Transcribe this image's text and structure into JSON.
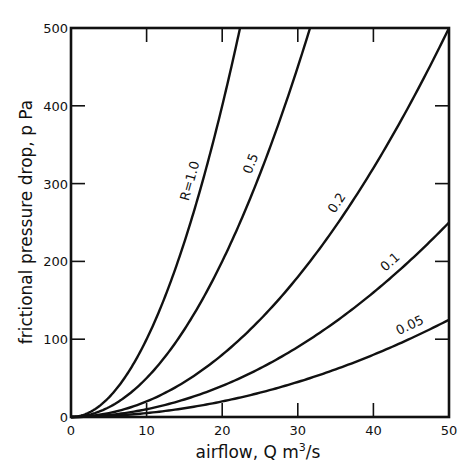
{
  "chart_data": {
    "type": "line",
    "title": "",
    "xlabel": "airflow,  Q  m³/s",
    "ylabel": "frictional pressure drop,  p  Pa",
    "xlim": [
      0,
      50
    ],
    "ylim": [
      0,
      500
    ],
    "x_ticks": [
      0,
      10,
      20,
      30,
      40,
      50
    ],
    "y_ticks": [
      0,
      100,
      200,
      300,
      400,
      500
    ],
    "grid": false,
    "legend": "inline labels on curves",
    "equation": "p = R * Q^2",
    "series": [
      {
        "name": "R=1.0",
        "label": "R=1.0",
        "R": 1.0,
        "x": [
          0,
          5,
          10,
          15,
          20,
          22.36
        ],
        "values": [
          0,
          25,
          100,
          225,
          400,
          500
        ]
      },
      {
        "name": "0.5",
        "label": "0.5",
        "R": 0.5,
        "x": [
          0,
          5,
          10,
          15,
          20,
          25,
          30,
          31.62
        ],
        "values": [
          0,
          12.5,
          50,
          112.5,
          200,
          312.5,
          450,
          500
        ]
      },
      {
        "name": "0.2",
        "label": "0.2",
        "R": 0.2,
        "x": [
          0,
          10,
          20,
          30,
          40,
          50
        ],
        "values": [
          0,
          20,
          80,
          180,
          320,
          500
        ]
      },
      {
        "name": "0.1",
        "label": "0.1",
        "R": 0.1,
        "x": [
          0,
          10,
          20,
          30,
          40,
          50
        ],
        "values": [
          0,
          10,
          40,
          90,
          160,
          250
        ]
      },
      {
        "name": "0.05",
        "label": "0.05",
        "R": 0.05,
        "x": [
          0,
          10,
          20,
          30,
          40,
          50
        ],
        "values": [
          0,
          5,
          20,
          45,
          80,
          125
        ]
      }
    ]
  },
  "labels": {
    "xlabel_main": "airflow,  Q  m",
    "xlabel_sup": "3",
    "xlabel_tail": "/s",
    "ylabel": "frictional pressure drop,  p  Pa"
  }
}
